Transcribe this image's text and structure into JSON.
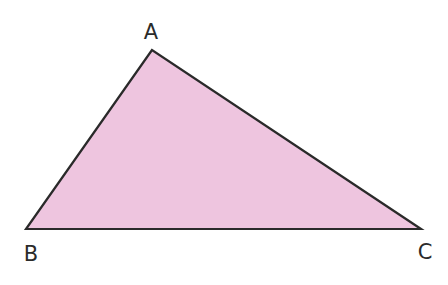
{
  "diagram": {
    "type": "triangle",
    "fill": "#eec5df",
    "stroke": "#2a2a2a",
    "vertices": [
      {
        "name": "A",
        "x": 152,
        "y": 50,
        "label_x": 151,
        "label_y": 32
      },
      {
        "name": "B",
        "x": 26,
        "y": 229,
        "label_x": 31,
        "label_y": 254
      },
      {
        "name": "C",
        "x": 421,
        "y": 229,
        "label_x": 425,
        "label_y": 252
      }
    ]
  }
}
